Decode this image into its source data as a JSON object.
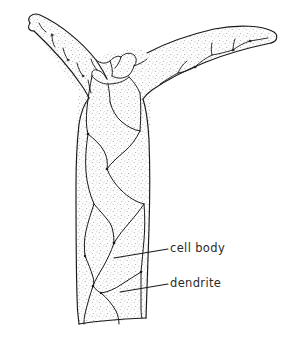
{
  "figure": {
    "style": "stippled ink line drawing",
    "background_color": "#ffffff",
    "ink_color": "#1a1a1a",
    "stipple_color": "#9a9a9a",
    "fill_color": "#fbfbfb"
  },
  "labels": [
    {
      "id": "cell-body",
      "text": "cell body",
      "text_x": 170,
      "text_y": 243,
      "leader_from_x": 168,
      "leader_from_y": 249,
      "leader_to_x": 114,
      "leader_to_y": 258
    },
    {
      "id": "dendrite",
      "text": "dendrite",
      "text_x": 170,
      "text_y": 278,
      "leader_from_x": 168,
      "leader_from_y": 284,
      "leader_to_x": 120,
      "leader_to_y": 292
    }
  ],
  "parts": {
    "left_arm_label": "left dendrite arm",
    "right_arm_label": "right dendrite arm",
    "trunk_label": "cell body trunk",
    "junction_label": "branch junction"
  }
}
